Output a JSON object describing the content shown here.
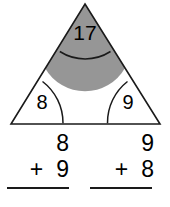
{
  "worksheet": {
    "title": "Fact family triangle with two addition problems",
    "figure": {
      "name": "fact-family-triangle",
      "shape": "triangle",
      "stroke_color": "#1a1a1a",
      "shaded_color": "#969696",
      "apex_angle": {
        "label": "17",
        "position": "top",
        "shaded": true
      },
      "bottom_left_angle": {
        "label": "8",
        "position": "bottom-left",
        "shaded": false
      },
      "bottom_right_angle": {
        "label": "9",
        "position": "bottom-right",
        "shaded": false
      }
    },
    "problems": [
      {
        "name": "addition-problem-left",
        "top_addend": "8",
        "operator": "+",
        "bottom_addend": "9",
        "answer": ""
      },
      {
        "name": "addition-problem-right",
        "top_addend": "9",
        "operator": "+",
        "bottom_addend": "8",
        "answer": ""
      }
    ]
  }
}
